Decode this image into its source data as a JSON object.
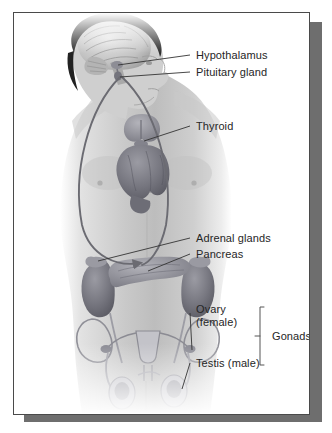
{
  "figure": {
    "frame_border_color": "#4a4a4a",
    "shadow_color": "#6e6e6e",
    "background_color": "#ffffff",
    "label_text_color": "#262626",
    "leader_line_color": "#3a3a3a",
    "arrow_color": "#6b6b72",
    "bracket_color": "#555555"
  },
  "labels": {
    "hypothalamus": "Hypothalamus",
    "pituitary": "Pituitary gland",
    "thyroid": "Thyroid",
    "adrenal": "Adrenal glands",
    "pancreas": "Pancreas",
    "ovary": "Ovary\n(female)",
    "testis": "Testis (male)",
    "gonads": "Gonads"
  }
}
